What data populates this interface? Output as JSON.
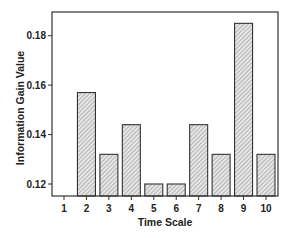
{
  "chart_data": {
    "type": "bar",
    "title": "",
    "xlabel": "Time Scale",
    "ylabel": "Information Gain Value",
    "categories": [
      "1",
      "2",
      "3",
      "4",
      "5",
      "6",
      "7",
      "8",
      "9",
      "10"
    ],
    "values": [
      null,
      0.157,
      0.132,
      0.144,
      0.12,
      0.12,
      0.144,
      0.132,
      0.185,
      0.132
    ],
    "ylim": [
      0.1155,
      0.1905
    ],
    "yticks": [
      0.12,
      0.14,
      0.16,
      0.18
    ],
    "ytick_labels": [
      "0.12",
      "0.14",
      "0.16",
      "0.18"
    ],
    "grid": false,
    "legend": null,
    "bar_fill": "hatched",
    "bar_color": "#d9d9d9",
    "hatch_color": "#8a8a8a",
    "edge_color": "#333333"
  }
}
